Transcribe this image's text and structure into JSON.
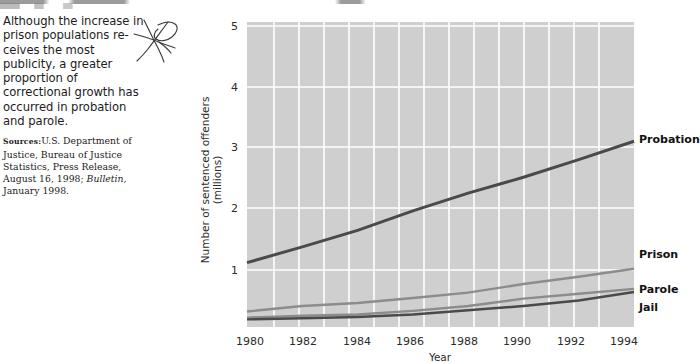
{
  "sidebar_text": {
    "lede": "Although the increase in prison populations re­ceives the most publicity, a greater proportion of correctional growth has occurred in probation and parole.",
    "sources_heading": "Sources:",
    "sources_body_1": "U.S. Department of Justice, Bureau of Justice Statis­tics, Press Release, August 16, 1998; ",
    "sources_italic": "Bulletin,",
    "sources_body_2": " January 1998."
  },
  "annotation": {
    "hand_mark": "handwritten-star-mark"
  },
  "chart_data": {
    "type": "line",
    "title": "",
    "xlabel": "Year",
    "ylabel": "Number of sentenced offenders\n(millions)",
    "ylabel_line1": "Number of sentenced offenders",
    "ylabel_line2": "(millions)",
    "x": [
      1980,
      1982,
      1984,
      1986,
      1988,
      1990,
      1992,
      1994
    ],
    "categories": [
      "1980",
      "1982",
      "1984",
      "1986",
      "1988",
      "1990",
      "1992",
      "1994"
    ],
    "xlim": [
      1980,
      1994
    ],
    "ylim": [
      0,
      5
    ],
    "yticks": [
      1,
      2,
      3,
      4,
      5
    ],
    "ytick_labels": [
      "1",
      "2",
      "3",
      "4",
      "5"
    ],
    "grid": true,
    "grid_color": "#ffffff",
    "plot_background": "#cfcfcf",
    "legend_position": "right-of-line-ends",
    "series": [
      {
        "name": "Probation",
        "color": "#4a4a4a",
        "values": [
          1.12,
          1.38,
          1.65,
          1.97,
          2.26,
          2.52,
          2.81,
          3.11
        ]
      },
      {
        "name": "Prison",
        "color": "#8c8c8c",
        "values": [
          0.32,
          0.41,
          0.46,
          0.54,
          0.63,
          0.77,
          0.89,
          1.02
        ]
      },
      {
        "name": "Parole",
        "color": "#8c8c8c",
        "values": [
          0.22,
          0.25,
          0.27,
          0.33,
          0.41,
          0.53,
          0.61,
          0.69
        ]
      },
      {
        "name": "Jail",
        "color": "#4a4a4a",
        "values": [
          0.19,
          0.21,
          0.23,
          0.27,
          0.34,
          0.41,
          0.5,
          0.64
        ]
      }
    ]
  }
}
